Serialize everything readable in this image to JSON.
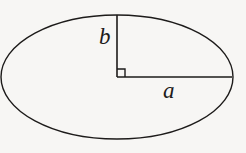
{
  "figure": {
    "kind": "ellipse-semi-axes-diagram",
    "background_color": "#f7f6f4",
    "stroke_color": "#1d1b1a",
    "canvas": {
      "width": 246,
      "height": 153
    },
    "ellipse": {
      "center_x": 117,
      "center_y": 77,
      "semi_major_a": 116,
      "semi_minor_b": 62,
      "stroke_width": 1.4,
      "fill": "none"
    },
    "semi_major_segment": {
      "name": "a",
      "from_x": 117,
      "from_y": 77,
      "to_x": 232,
      "to_y": 77,
      "stroke_width": 1.6
    },
    "semi_minor_segment": {
      "name": "b",
      "from_x": 117,
      "from_y": 77,
      "to_x": 117,
      "to_y": 15,
      "stroke_width": 1.6
    },
    "right_angle_marker": {
      "x": 117,
      "y": 69,
      "size": 8,
      "stroke_width": 1.4,
      "orientation": "up-right"
    },
    "labels": {
      "semi_minor": "b",
      "semi_major": "a"
    }
  }
}
